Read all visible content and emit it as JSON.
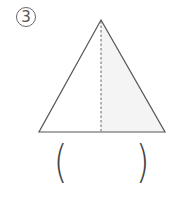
{
  "problem": {
    "number_label": "3",
    "answer_open": "(",
    "answer_close": ")",
    "answer_value": ""
  },
  "figure": {
    "shape": "isosceles-triangle",
    "apex": [
      101,
      20
    ],
    "base_left": [
      39,
      132
    ],
    "base_right": [
      165,
      132
    ],
    "divider": "dashed-vertical-midline",
    "shaded_half": "right",
    "stroke_color": "#555555",
    "shade_color": "#f4f4f4"
  }
}
